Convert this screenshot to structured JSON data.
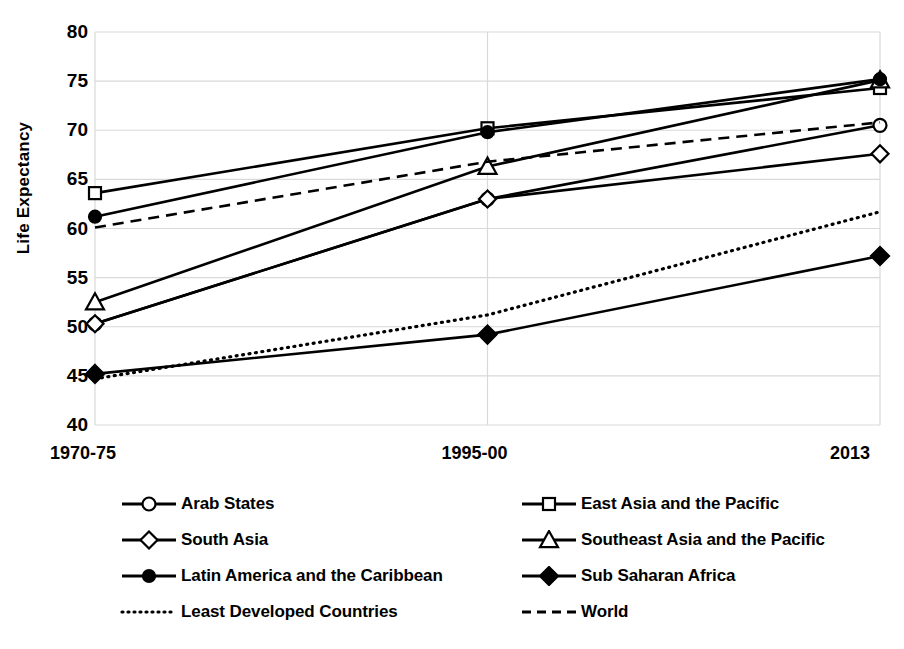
{
  "chart_data": {
    "type": "line",
    "title": "",
    "xlabel": "",
    "ylabel": "Life Expectancy",
    "categories": [
      "1970-75",
      "1995-00",
      "2013"
    ],
    "ylim": [
      40,
      80
    ],
    "yticks": [
      40,
      45,
      50,
      55,
      60,
      65,
      70,
      75,
      80
    ],
    "grid": true,
    "legend_position": "bottom",
    "series": [
      {
        "name": "Arab States",
        "marker": "open-circle",
        "line": "solid",
        "color": "#000000",
        "values": [
          50.3,
          63.0,
          70.5
        ]
      },
      {
        "name": "East Asia and the Pacific",
        "marker": "open-square",
        "line": "solid",
        "color": "#000000",
        "values": [
          63.6,
          70.2,
          74.3
        ]
      },
      {
        "name": "South Asia",
        "marker": "open-diamond",
        "line": "solid",
        "color": "#000000",
        "values": [
          50.3,
          63.0,
          67.6
        ]
      },
      {
        "name": "Southeast Asia and the Pacific",
        "marker": "open-triangle",
        "line": "solid",
        "color": "#000000",
        "values": [
          52.5,
          66.3,
          75.1
        ]
      },
      {
        "name": "Latin America and the Caribbean",
        "marker": "filled-circle",
        "line": "solid",
        "color": "#000000",
        "values": [
          61.2,
          69.8,
          75.2
        ]
      },
      {
        "name": "Sub Saharan Africa",
        "marker": "filled-diamond",
        "line": "solid",
        "color": "#000000",
        "values": [
          45.2,
          49.2,
          57.2
        ]
      },
      {
        "name": "Least Developed Countries",
        "marker": "none",
        "line": "dotted",
        "color": "#000000",
        "values": [
          44.7,
          51.2,
          61.7
        ]
      },
      {
        "name": "World",
        "marker": "none",
        "line": "dashed",
        "color": "#000000",
        "values": [
          60.1,
          66.8,
          70.8
        ]
      }
    ]
  },
  "axis": {
    "y_label": "Life Expectancy",
    "y_ticks": [
      "40",
      "45",
      "50",
      "55",
      "60",
      "65",
      "70",
      "75",
      "80"
    ],
    "x_ticks": [
      "1970-75",
      "1995-00",
      "2013"
    ]
  },
  "legend": {
    "rows": [
      [
        {
          "label": "Arab States",
          "marker": "open-circle",
          "line": "solid"
        },
        {
          "label": "East Asia and the Pacific",
          "marker": "open-square",
          "line": "solid"
        }
      ],
      [
        {
          "label": "South Asia",
          "marker": "open-diamond",
          "line": "solid"
        },
        {
          "label": "Southeast Asia and the Pacific",
          "marker": "open-triangle",
          "line": "solid"
        }
      ],
      [
        {
          "label": "Latin America and the Caribbean",
          "marker": "filled-circle",
          "line": "solid"
        },
        {
          "label": "Sub Saharan Africa",
          "marker": "filled-diamond",
          "line": "solid"
        }
      ],
      [
        {
          "label": "Least Developed Countries",
          "marker": "none",
          "line": "dotted"
        },
        {
          "label": "World",
          "marker": "none",
          "line": "dashed"
        }
      ]
    ]
  },
  "colors": {
    "line": "#000000",
    "grid": "#d9d9d9",
    "background": "#ffffff",
    "marker_fill": "#ffffff"
  }
}
